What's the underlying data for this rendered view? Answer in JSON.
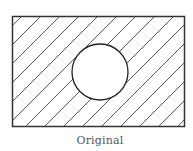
{
  "figure": {
    "caption": "Original",
    "rect": {
      "x": 12.5,
      "y": 16.5,
      "width": 172,
      "height": 110,
      "stroke": "#333333",
      "stroke_width": 1.5
    },
    "hatch": {
      "angle_deg": 45,
      "spacing": 19,
      "stroke": "#555555",
      "stroke_width": 0.9
    },
    "circle": {
      "cx": 100,
      "cy": 72,
      "r": 28,
      "fill": "#ffffff",
      "stroke": "#222222",
      "stroke_width": 1.3
    }
  }
}
